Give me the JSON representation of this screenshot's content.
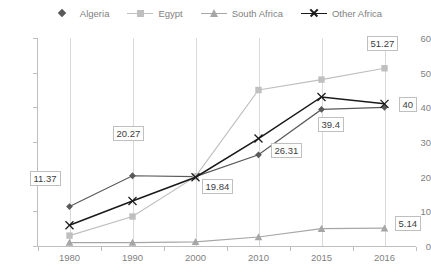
{
  "legend": {
    "position": "top",
    "items": [
      {
        "label": "Algeria",
        "marker": "diamond-marker",
        "color": "#595959",
        "show_line": false
      },
      {
        "label": "Egypt",
        "marker": "square-marker",
        "color": "#bfbfbf",
        "show_line": true
      },
      {
        "label": "South Africa",
        "marker": "triangle-marker",
        "color": "#a6a6a6",
        "show_line": true
      },
      {
        "label": "Other Africa",
        "marker": "x-marker",
        "color": "#1a1a1a",
        "show_line": true
      }
    ]
  },
  "axes": {
    "y_ticks": [
      "0",
      "10",
      "20",
      "30",
      "40",
      "50",
      "60"
    ],
    "x_ticks": [
      "1980",
      "1990",
      "2000",
      "2010",
      "2015",
      "2016"
    ]
  },
  "chart_data": {
    "type": "line",
    "title": "",
    "subtitle": "",
    "xlabel": "",
    "ylabel": "",
    "categories": [
      "1980",
      "1990",
      "2000",
      "2010",
      "2015",
      "2016"
    ],
    "ylim": [
      0,
      60
    ],
    "ytick_step": 10,
    "grid": "vertical",
    "legend_position": "top",
    "series": [
      {
        "name": "Algeria",
        "color": "#595959",
        "marker": "diamond",
        "values": [
          11.37,
          20.27,
          20.0,
          26.31,
          39.4,
          40.0
        ],
        "labels": [
          {
            "category": "1980",
            "value": 11.37,
            "text": "11.37"
          },
          {
            "category": "1990",
            "value": 20.27,
            "text": "20.27"
          },
          {
            "category": "2010",
            "value": 26.31,
            "text": "26.31"
          },
          {
            "category": "2015",
            "value": 39.4,
            "text": "39.4"
          },
          {
            "category": "2016",
            "value": 40.0,
            "text": "40"
          }
        ]
      },
      {
        "name": "Egypt",
        "color": "#bfbfbf",
        "marker": "square",
        "values": [
          3.0,
          8.5,
          20.0,
          45.0,
          48.0,
          51.27
        ],
        "labels": [
          {
            "category": "2016",
            "value": 51.27,
            "text": "51.27"
          }
        ]
      },
      {
        "name": "South Africa",
        "color": "#a6a6a6",
        "marker": "triangle",
        "values": [
          1.0,
          1.0,
          1.2,
          2.6,
          5.0,
          5.14
        ],
        "labels": [
          {
            "category": "2016",
            "value": 5.14,
            "text": "5.14"
          }
        ]
      },
      {
        "name": "Other Africa",
        "color": "#1a1a1a",
        "marker": "x",
        "values": [
          6.0,
          13.0,
          19.84,
          31.0,
          43.0,
          41.0
        ],
        "labels": [
          {
            "category": "2000",
            "value": 19.84,
            "text": "19.84"
          }
        ]
      }
    ]
  }
}
